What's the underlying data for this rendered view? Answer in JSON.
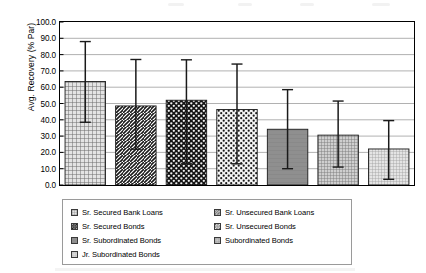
{
  "chart_data": {
    "type": "bar",
    "title": "",
    "subtitle": "",
    "xlabel": "",
    "ylabel": "Avg. Recovery (% Par)",
    "ylim": [
      0.0,
      100.0
    ],
    "ytick_step": 10.0,
    "ytick_labels": [
      "100.0",
      "90.0",
      "80.0",
      "70.0",
      "60.0",
      "50.0",
      "40.0",
      "30.0",
      "20.0",
      "10.0",
      "0.0"
    ],
    "ytick_values": [
      100.0,
      90.0,
      80.0,
      70.0,
      60.0,
      50.0,
      40.0,
      30.0,
      20.0,
      10.0,
      0.0
    ],
    "grid": true,
    "grid_axis": "y",
    "legend_position": "bottom",
    "xtick_labels": [],
    "categories": [
      "Sr. Secured Bank Loans",
      "Sr. Unsecured Bank Loans",
      "Sr. Secured Bonds",
      "Sr. Unsecured Bonds",
      "Sr. Subordinated Bonds",
      "Subordinated Bonds",
      "Jr. Subordinated Bonds"
    ],
    "values": [
      63.5,
      48.5,
      52.0,
      46.3,
      34.2,
      30.6,
      22.1
    ],
    "error_high": [
      88.0,
      77.0,
      76.8,
      74.2,
      58.5,
      51.5,
      39.5
    ],
    "error_low": [
      38.5,
      22.0,
      13.0,
      13.0,
      10.0,
      11.0,
      3.5
    ],
    "series": [
      {
        "name": "Avg. Recovery (% Par)",
        "values": [
          63.5,
          48.5,
          52.0,
          46.3,
          34.2,
          30.6,
          22.1
        ]
      }
    ]
  },
  "legend": {
    "items": [
      {
        "label": "Sr. Secured Bank Loans",
        "pattern": "fine-grid",
        "icon": "legend-swatch-fine-grid"
      },
      {
        "label": "Sr. Unsecured Bank Loans",
        "pattern": "diagonal",
        "icon": "legend-swatch-diagonal"
      },
      {
        "label": "Sr. Secured Bonds",
        "pattern": "dense-dots",
        "icon": "legend-swatch-dense-dots"
      },
      {
        "label": "Sr. Unsecured Bonds",
        "pattern": "sparse-dots",
        "icon": "legend-swatch-sparse-dots"
      },
      {
        "label": "Sr. Subordinated Bonds",
        "pattern": "solid-gray",
        "icon": "legend-swatch-solid-gray"
      },
      {
        "label": "Subordinated Bonds",
        "pattern": "medium-grid",
        "icon": "legend-swatch-medium-grid"
      },
      {
        "label": "Jr. Subordinated Bonds",
        "pattern": "light-grid",
        "icon": "legend-swatch-light-grid"
      }
    ]
  },
  "colors": {
    "axis": "#000000",
    "grid": "#a8a8a8",
    "error_bar": "#1a1a1a",
    "bar_light": "#d8d8d8",
    "bar_gray": "#8c8c8c",
    "legend_border": "#9a9a9a"
  }
}
